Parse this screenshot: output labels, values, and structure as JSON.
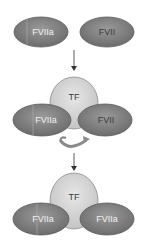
{
  "diagram": {
    "stage1": {
      "left_ellipse": "FVIIa",
      "right_ellipse": "FVII"
    },
    "stage2": {
      "center": "TF",
      "left_ellipse": "FVIIa",
      "right_ellipse": "FVII",
      "conversion_arrow": "curved-arrow"
    },
    "stage3": {
      "center": "TF",
      "left_ellipse": "FVIIa",
      "right_ellipse": "FVIIa"
    },
    "colors": {
      "factor_ellipse": "#7a7a7a",
      "factor_stroke": "#555555",
      "tf_body": "#d6d6d6",
      "tf_stroke": "#8c8c8c",
      "arrow": "#333333"
    }
  }
}
